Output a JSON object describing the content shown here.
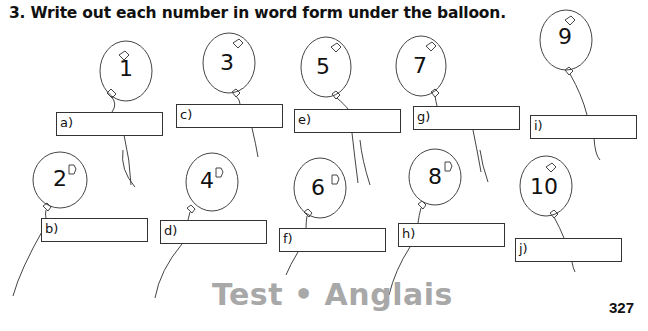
{
  "instruction": {
    "number": "3.",
    "text": "3.  Write out each number in word form under the balloon."
  },
  "balloons": [
    {
      "digit": "1",
      "label": "a)",
      "answer": ""
    },
    {
      "digit": "2",
      "label": "b)",
      "answer": ""
    },
    {
      "digit": "3",
      "label": "c)",
      "answer": ""
    },
    {
      "digit": "4",
      "label": "d)",
      "answer": ""
    },
    {
      "digit": "5",
      "label": "e)",
      "answer": ""
    },
    {
      "digit": "6",
      "label": "f)",
      "answer": ""
    },
    {
      "digit": "7",
      "label": "g)",
      "answer": ""
    },
    {
      "digit": "8",
      "label": "h)",
      "answer": ""
    },
    {
      "digit": "9",
      "label": "i)",
      "answer": ""
    },
    {
      "digit": "10",
      "label": "j)",
      "answer": ""
    }
  ],
  "footer": {
    "watermark": "Test • Anglais",
    "page_number": "327"
  },
  "colors": {
    "ink": "#111111",
    "watermark": "#a8a8a8"
  }
}
